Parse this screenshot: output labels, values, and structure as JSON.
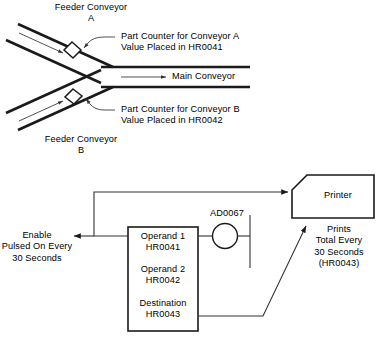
{
  "diagram": {
    "title_implicit": "Conveyor part counting and print totaling diagram",
    "upper": {
      "feeder_a_label": "Feeder Conveyor\nA",
      "feeder_b_label": "Feeder Conveyor\nB",
      "main_conveyor_label": "Main Conveyor",
      "counter_a_label": "Part Counter for Conveyor A\nValue Placed in HR0041",
      "counter_b_label": "Part Counter for Conveyor B\nValue Placed in HR0042",
      "counter_a_register": "HR0041",
      "counter_b_register": "HR0042"
    },
    "lower": {
      "enable_label": "Enable\nPulsed On Every\n30 Seconds",
      "instruction_box": {
        "operand1_name": "Operand 1",
        "operand1_value": "HR0041",
        "operand2_name": "Operand 2",
        "operand2_value": "HR0042",
        "destination_name": "Destination",
        "destination_value": "HR0043"
      },
      "coil_label": "AD0067",
      "printer_label": "Printer",
      "printer_note": "Prints\nTotal Every\n30 Seconds\n(HR0043)"
    }
  },
  "colors": {
    "line": "#1a1a1a",
    "thin_line": "#555555",
    "background": "#ffffff",
    "text": "#000000"
  }
}
